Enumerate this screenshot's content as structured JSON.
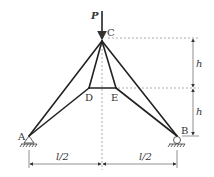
{
  "diagram": {
    "type": "truss",
    "load": {
      "label": "P",
      "node": "C",
      "direction": "down"
    },
    "nodes": {
      "A": {
        "label": "A",
        "support": "pin"
      },
      "B": {
        "label": "B",
        "support": "roller"
      },
      "C": {
        "label": "C"
      },
      "D": {
        "label": "D"
      },
      "E": {
        "label": "E"
      }
    },
    "members": [
      [
        "A",
        "C"
      ],
      [
        "B",
        "C"
      ],
      [
        "A",
        "D"
      ],
      [
        "B",
        "E"
      ],
      [
        "C",
        "D"
      ],
      [
        "C",
        "E"
      ],
      [
        "D",
        "E"
      ]
    ],
    "dimensions": {
      "vertical": [
        {
          "label": "h",
          "from": "C",
          "to": "DE"
        },
        {
          "label": "h",
          "from": "DE",
          "to": "B"
        }
      ],
      "horizontal": [
        {
          "label": "l/2",
          "from": "A",
          "to": "center"
        },
        {
          "label": "l/2",
          "from": "center",
          "to": "B"
        }
      ]
    }
  }
}
